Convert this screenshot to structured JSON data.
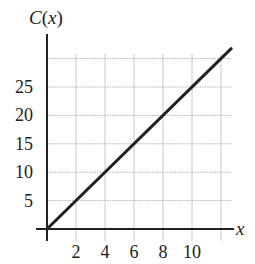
{
  "chart_data": {
    "type": "line",
    "title": "",
    "xlabel": "x",
    "ylabel": "C(x)",
    "ylabel_parts": {
      "fn": "C",
      "open": "(",
      "var": "x",
      "close": ")"
    },
    "x_ticks": [
      2,
      4,
      6,
      8,
      10
    ],
    "y_ticks": [
      5,
      10,
      15,
      20,
      25
    ],
    "x_grid": [
      2,
      4,
      6,
      8,
      10,
      12
    ],
    "y_grid": [
      5,
      10,
      15,
      20,
      25,
      30
    ],
    "xlim": [
      0,
      12.7
    ],
    "ylim": [
      0,
      32
    ],
    "grid": true,
    "legend": null,
    "series": [
      {
        "name": "C(x)",
        "x": [
          0,
          12.7
        ],
        "values": [
          0,
          31.75
        ],
        "equation": "C(x) = 2.5x",
        "color": "#222222"
      }
    ]
  }
}
